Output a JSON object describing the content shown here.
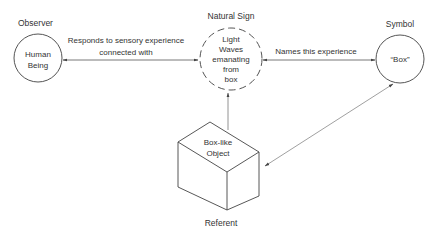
{
  "diagram": {
    "type": "semiotic triangle",
    "nodes": {
      "observer": {
        "heading": "Observer",
        "lines": [
          "Human",
          "Being"
        ]
      },
      "natural_sign": {
        "heading": "Natural Sign",
        "lines": [
          "Light",
          "Waves",
          "emanating",
          "from",
          "box"
        ]
      },
      "symbol": {
        "heading": "Symbol",
        "lines": [
          "“Box”"
        ]
      },
      "referent": {
        "heading": "Referent",
        "lines": [
          "Box-like",
          "Object"
        ]
      }
    },
    "edges": {
      "observer_sign": {
        "lines": [
          "Responds to sensory experience",
          "connected with"
        ],
        "style": "double-arrow"
      },
      "sign_symbol": {
        "lines": [
          "Names this experience"
        ],
        "style": "double-arrow"
      },
      "referent_sign": {
        "style": "arrow"
      },
      "symbol_referent": {
        "style": "double-arrow"
      }
    },
    "colors": {
      "stroke": "#555555",
      "text": "#333333",
      "background": "#ffffff"
    }
  }
}
